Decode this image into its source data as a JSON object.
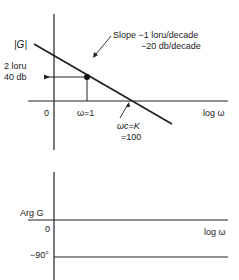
{
  "magnitude_plot": {
    "y_label": "|G|",
    "level_label_line1": "2 loru",
    "level_label_line2": "40 db",
    "origin_label": "0",
    "omega1_label": "ω=1",
    "x_axis_label": "log ω",
    "slope_line1": "Slope −1 loru/decade",
    "slope_line2": "−20 db/decade",
    "crossover_line1": "ωc=K",
    "crossover_line2": "=100"
  },
  "phase_plot": {
    "y_label": "Arg G",
    "zero_label": "0",
    "x_axis_label": "log ω",
    "minus90_label": "−90°"
  },
  "colors": {
    "ink": "#222222",
    "background": "#ffffff"
  }
}
